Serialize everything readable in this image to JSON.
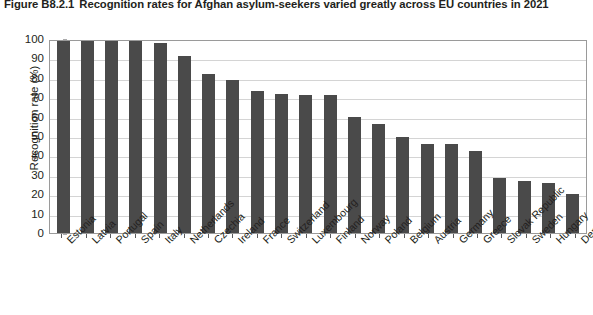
{
  "title": {
    "figure_number": "Figure B8.2.1",
    "text": "Recognition rates for Afghan asylum-seekers varied greatly across EU countries in 2021"
  },
  "colors": {
    "bar": "#4a4a4a",
    "gridline": "#d4d4d4",
    "axis": "#58595b",
    "text": "#231f20",
    "background": "#ffffff"
  },
  "chart_data": {
    "type": "bar",
    "title": "Recognition rates for Afghan asylum-seekers varied greatly across EU countries in 2021",
    "xlabel": "",
    "ylabel": "Recognition rate (%)",
    "ylim": [
      0,
      100
    ],
    "ytick_step": 10,
    "yticks": [
      100,
      90,
      80,
      70,
      60,
      50,
      40,
      30,
      20,
      10,
      0
    ],
    "grid": true,
    "legend": null,
    "categories": [
      "Estonia",
      "Latvia",
      "Portugal",
      "Spain",
      "Italy",
      "Netherlands",
      "Czechia",
      "Ireland",
      "France",
      "Switzerland",
      "Luxembourg",
      "Finland",
      "Norway",
      "Poland",
      "Belgium",
      "Austria",
      "Germany",
      "Greece",
      "Slovak Republic",
      "Sweden",
      "Hungary",
      "Denmark"
    ],
    "values": [
      100,
      100,
      100,
      100,
      98,
      91,
      82,
      79,
      73,
      71.5,
      71,
      71,
      60,
      56,
      49.5,
      46,
      46,
      42.5,
      28.5,
      27,
      26,
      20
    ]
  }
}
